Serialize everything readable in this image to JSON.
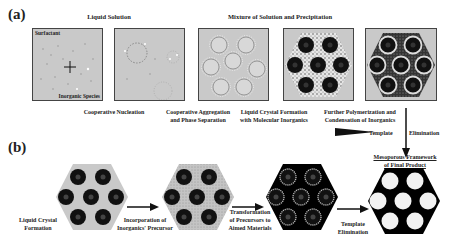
{
  "panel_a": {
    "label": "(a)",
    "group_headers": {
      "liquid_solution": "Liquid Solution",
      "mixture": "Mixture of Solution and Precipitation"
    },
    "box1_labels": {
      "top": "Surfactant",
      "bottom": "Inorganic Species"
    },
    "steps": [
      {
        "caption_line1": "Cooperative Nucleation",
        "caption_line2": ""
      },
      {
        "caption_line1": "Cooperative Aggregation",
        "caption_line2": "and Phase Separation"
      },
      {
        "caption_line1": "Liquid Crystal Formation",
        "caption_line2": "with Molecular Inorganics"
      },
      {
        "caption_line1": "Further Polymerization and",
        "caption_line2": "Condensation of Inorganics"
      }
    ],
    "vertical_arrow_label_left": "Template",
    "vertical_arrow_label_right": "Elimination"
  },
  "panel_b": {
    "label": "(b)",
    "final_label_line1": "Mesoporous Framework",
    "final_label_line2": "of Final Product",
    "captions": [
      {
        "line1": "Liquid Crystal",
        "line2": "Formation"
      },
      {
        "line1": "Incorporation of",
        "line2": "Inorganics' Precursor"
      },
      {
        "line1": "Transformation",
        "line2": "of Precursors to",
        "line3": "Aimed Materials"
      },
      {
        "line1": "Template",
        "line2": "Elimination"
      }
    ]
  },
  "colors": {
    "box_fill": "#c9c9c9",
    "micelle": "#111111",
    "framework": "#000000",
    "pore": "#f2f2f2"
  }
}
